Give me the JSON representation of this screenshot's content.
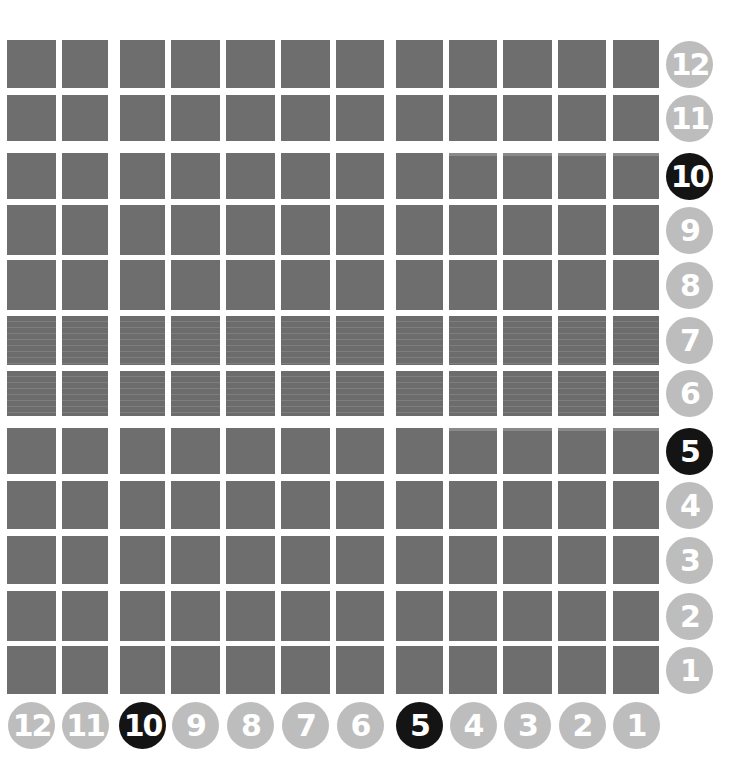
{
  "colors": {
    "tile": "#6e6e6e",
    "badge_inactive": "#bdbdbd",
    "badge_active": "#141414",
    "badge_text": "#ffffff",
    "background": "#ffffff"
  },
  "grid": {
    "columns": 12,
    "rows": 12,
    "col_x": [
      7,
      62,
      120,
      171,
      226,
      281,
      336,
      396,
      449,
      503,
      558,
      613
    ],
    "col_w": [
      49,
      46,
      45,
      49,
      49,
      49,
      48,
      47,
      48,
      49,
      48,
      46
    ],
    "row_y": [
      40,
      95,
      153,
      205,
      260,
      316,
      371,
      428,
      481,
      536,
      591,
      646
    ],
    "row_h": [
      48,
      46,
      46,
      50,
      50,
      49,
      45,
      46,
      48,
      48,
      50,
      48
    ],
    "striped_rows": [
      7,
      6
    ],
    "topline_rows": [
      10,
      5
    ]
  },
  "row_labels": [
    {
      "label": "12",
      "active": false
    },
    {
      "label": "11",
      "active": false
    },
    {
      "label": "10",
      "active": true
    },
    {
      "label": "9",
      "active": false
    },
    {
      "label": "8",
      "active": false
    },
    {
      "label": "7",
      "active": false
    },
    {
      "label": "6",
      "active": false
    },
    {
      "label": "5",
      "active": true
    },
    {
      "label": "4",
      "active": false
    },
    {
      "label": "3",
      "active": false
    },
    {
      "label": "2",
      "active": false
    },
    {
      "label": "1",
      "active": false
    }
  ],
  "column_labels": [
    {
      "label": "12",
      "active": false
    },
    {
      "label": "11",
      "active": false
    },
    {
      "label": "10",
      "active": true
    },
    {
      "label": "9",
      "active": false
    },
    {
      "label": "8",
      "active": false
    },
    {
      "label": "7",
      "active": false
    },
    {
      "label": "6",
      "active": false
    },
    {
      "label": "5",
      "active": true
    },
    {
      "label": "4",
      "active": false
    },
    {
      "label": "3",
      "active": false
    },
    {
      "label": "2",
      "active": false
    },
    {
      "label": "1",
      "active": false
    }
  ]
}
